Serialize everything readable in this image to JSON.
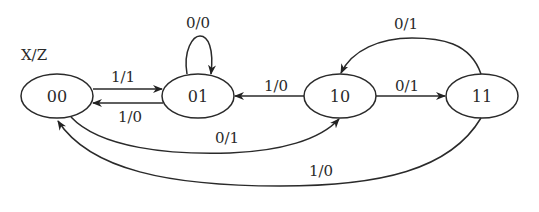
{
  "diagram": {
    "type": "state-transition",
    "legend": "X/Z",
    "states": [
      {
        "id": "00",
        "label": "00"
      },
      {
        "id": "01",
        "label": "01"
      },
      {
        "id": "10",
        "label": "10"
      },
      {
        "id": "11",
        "label": "11"
      }
    ],
    "transitions": [
      {
        "from": "00",
        "to": "01",
        "label": "1/1"
      },
      {
        "from": "01",
        "to": "00",
        "label": "1/0"
      },
      {
        "from": "01",
        "to": "01",
        "label": "0/0"
      },
      {
        "from": "10",
        "to": "01",
        "label": "1/0"
      },
      {
        "from": "00",
        "to": "10",
        "label": "0/1"
      },
      {
        "from": "10",
        "to": "11",
        "label": "0/1"
      },
      {
        "from": "11",
        "to": "10",
        "label": "0/1"
      },
      {
        "from": "11",
        "to": "00",
        "label": "1/0"
      }
    ]
  }
}
